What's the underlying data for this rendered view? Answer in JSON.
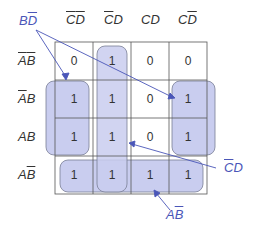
{
  "kmap": {
    "column_headers": [
      {
        "parts": [
          {
            "t": "C",
            "bar": true
          },
          {
            "t": "D",
            "bar": true
          }
        ]
      },
      {
        "parts": [
          {
            "t": "C",
            "bar": true
          },
          {
            "t": "D",
            "bar": false
          }
        ]
      },
      {
        "parts": [
          {
            "t": "C",
            "bar": false
          },
          {
            "t": "D",
            "bar": false
          }
        ]
      },
      {
        "parts": [
          {
            "t": "C",
            "bar": false
          },
          {
            "t": "D",
            "bar": true
          }
        ]
      }
    ],
    "row_headers": [
      {
        "parts": [
          {
            "t": "A",
            "bar": true
          },
          {
            "t": "B",
            "bar": true
          }
        ]
      },
      {
        "parts": [
          {
            "t": "A",
            "bar": true
          },
          {
            "t": "B",
            "bar": false
          }
        ]
      },
      {
        "parts": [
          {
            "t": "A",
            "bar": false
          },
          {
            "t": "B",
            "bar": false
          }
        ]
      },
      {
        "parts": [
          {
            "t": "A",
            "bar": false
          },
          {
            "t": "B",
            "bar": true
          }
        ]
      }
    ],
    "cells": [
      [
        "0",
        "1",
        "0",
        "0"
      ],
      [
        "1",
        "1",
        "0",
        "1"
      ],
      [
        "1",
        "1",
        "0",
        "1"
      ],
      [
        "1",
        "1",
        "1",
        "1"
      ]
    ],
    "group_labels": {
      "bd_bar": {
        "parts": [
          {
            "t": "B",
            "bar": false
          },
          {
            "t": "D",
            "bar": true
          }
        ]
      },
      "c_bar_d": {
        "parts": [
          {
            "t": "C",
            "bar": true
          },
          {
            "t": "D",
            "bar": false
          }
        ]
      },
      "a_b_bar": {
        "parts": [
          {
            "t": "A",
            "bar": false
          },
          {
            "t": "B",
            "bar": true
          }
        ]
      }
    },
    "colors": {
      "group_fill": "#c9cdef",
      "group_stroke": "#7a7f95",
      "arrow": "#4a56b8",
      "grid": "#555555"
    }
  }
}
